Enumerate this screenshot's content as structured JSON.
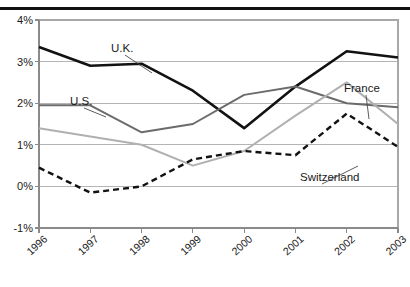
{
  "chart_data": {
    "type": "line",
    "title": "",
    "xlabel": "",
    "ylabel": "",
    "categories": [
      "1996",
      "1997",
      "1998",
      "1999",
      "2000",
      "2001",
      "2002",
      "2003"
    ],
    "ylim": [
      -1,
      4
    ],
    "yticks": [
      4,
      3,
      2,
      1,
      0,
      -1
    ],
    "ytick_labels": [
      "4%",
      "3%",
      "2%",
      "1%",
      "0%",
      "-1%"
    ],
    "grid": true,
    "legend_position": "inline-annotations",
    "series": [
      {
        "name": "U.K.",
        "color": "#121212",
        "style": "solid",
        "width": 2.6,
        "values": [
          3.35,
          2.9,
          2.95,
          2.3,
          1.4,
          2.4,
          3.25,
          3.1
        ]
      },
      {
        "name": "U.S.",
        "color": "#6b6b6b",
        "style": "solid",
        "width": 2.0,
        "values": [
          1.95,
          1.95,
          1.3,
          1.5,
          2.2,
          2.4,
          2.0,
          1.9
        ]
      },
      {
        "name": "France",
        "color": "#b0b0b0",
        "style": "solid",
        "width": 2.0,
        "values": [
          1.4,
          1.2,
          1.0,
          0.5,
          0.85,
          1.7,
          2.5,
          1.5
        ]
      },
      {
        "name": "Switzerland",
        "color": "#121212",
        "style": "dashed",
        "width": 2.4,
        "values": [
          0.45,
          -0.15,
          0.0,
          0.65,
          0.85,
          0.75,
          1.75,
          0.95
        ]
      }
    ],
    "annotations": [
      {
        "text": "U.K.",
        "x": 111,
        "y": 52
      },
      {
        "text": "U.S.",
        "x": 70,
        "y": 105
      },
      {
        "text": "France",
        "x": 344,
        "y": 92
      },
      {
        "text": "Switzerland",
        "x": 300,
        "y": 181
      }
    ]
  },
  "axis": {
    "ytick_labels": [
      "4%",
      "3%",
      "2%",
      "1%",
      "0%",
      "-1%"
    ],
    "xtick_labels": [
      "1996",
      "1997",
      "1998",
      "1999",
      "2000",
      "2001",
      "2002",
      "2003"
    ]
  }
}
